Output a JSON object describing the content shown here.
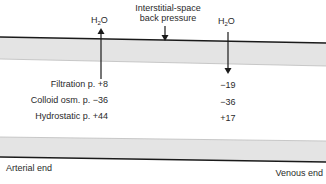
{
  "diagram": {
    "top_labels": {
      "left_flow": {
        "main": "H",
        "sub": "2",
        "tail": "O"
      },
      "right_flow": {
        "main": "H",
        "sub": "2",
        "tail": "O"
      },
      "back_pressure_line1": "Interstitial-space",
      "back_pressure_line2": "back pressure"
    },
    "arterial": {
      "filtration": "Filtration p. +8",
      "colloid": "Colloid osm. p. −36",
      "hydrostatic": "Hydrostatic p. +44"
    },
    "venous": {
      "filtration": "−19",
      "colloid": "−36",
      "hydrostatic": "+17"
    },
    "ends": {
      "arterial": "Arterial end",
      "venous": "Venous end"
    },
    "colors": {
      "band_fill": "#e4e4e4",
      "line": "#1a1a1a",
      "text": "#2a2a2a"
    }
  }
}
